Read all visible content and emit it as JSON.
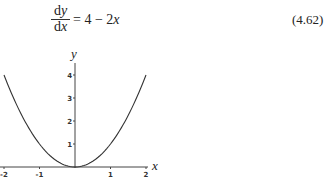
{
  "equation": {
    "numerator": "dy",
    "numerator_d": "d",
    "numerator_var": "y",
    "denominator_d": "d",
    "denominator_var": "x",
    "rhs_prefix": "= 4 − 2",
    "rhs_var": "x",
    "number": "(4.62)"
  },
  "chart_data": {
    "type": "line",
    "title": "",
    "function": "y = x^2",
    "xlabel": "x",
    "ylabel": "y",
    "xlim": [
      -2,
      2
    ],
    "ylim": [
      0,
      4
    ],
    "x_ticks": [
      "-2",
      "-1",
      "1",
      "2"
    ],
    "y_ticks": [
      "1",
      "2",
      "3",
      "4"
    ],
    "grid": false,
    "series": [
      {
        "name": "parabola",
        "x": [
          -2,
          -1.5,
          -1,
          -0.5,
          0,
          0.5,
          1,
          1.5,
          2
        ],
        "values": [
          4,
          2.25,
          1,
          0.25,
          0,
          0.25,
          1,
          2.25,
          4
        ]
      }
    ]
  }
}
